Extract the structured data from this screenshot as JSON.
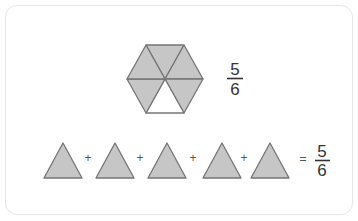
{
  "diagram": {
    "colors": {
      "fill": "#c6c6c6",
      "stroke": "#767676",
      "empty": "#ffffff",
      "text": "#333333",
      "border": "#e6e6e6"
    },
    "hexagon": {
      "total_parts": 6,
      "shaded_parts": 5,
      "fraction": {
        "numerator": "5",
        "denominator": "6"
      }
    },
    "equation": {
      "terms": 5,
      "operators": [
        "+",
        "+",
        "+",
        "+"
      ],
      "equals": "=",
      "result": {
        "numerator": "5",
        "denominator": "6"
      }
    }
  }
}
